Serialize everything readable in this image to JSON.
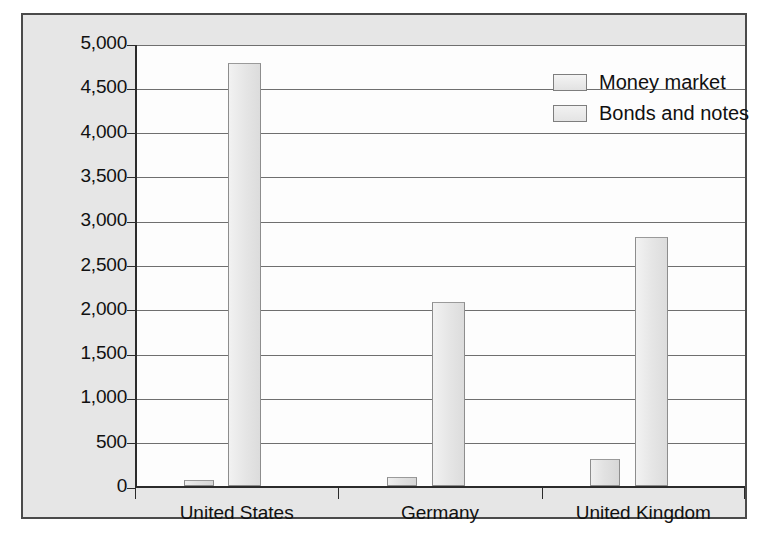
{
  "chart_data": {
    "type": "bar",
    "title": "",
    "xlabel": "",
    "ylabel": "",
    "categories": [
      "United States",
      "Germany",
      "United Kingdom"
    ],
    "series": [
      {
        "name": "Money market",
        "values": [
          70,
          100,
          300
        ]
      },
      {
        "name": "Bonds and notes",
        "values": [
          4780,
          2080,
          2810
        ]
      }
    ],
    "ylim": [
      0,
      5000
    ],
    "ytick_values": [
      0,
      500,
      1000,
      1500,
      2000,
      2500,
      3000,
      3500,
      4000,
      4500,
      5000
    ],
    "ytick_labels": [
      "0",
      "500",
      "1,000",
      "1,500",
      "2,000",
      "2,500",
      "3,000",
      "3,500",
      "4,000",
      "4,500",
      "5,000"
    ],
    "grid": true,
    "legend_position": "top-right",
    "colors": {
      "series_money_market": "#e2e2e2",
      "series_bonds_notes": "#e6e6e6",
      "grid": "#6f6f6f",
      "axis": "#2b2b2b",
      "frame": "#4a4a4a",
      "figure_background": "#e6e6e6",
      "plot_background": "#fdfdfd",
      "text": "#111111"
    }
  },
  "legend": {
    "items": [
      {
        "label": "Money market"
      },
      {
        "label": "Bonds and notes"
      }
    ]
  },
  "bleed_through": [
    {
      "text": "Calculating Returns on a Eurodollar Deposit",
      "x": 150,
      "y": 128,
      "size": 22,
      "weight": "bold"
    },
    {
      "text": "er gain the liquid-",
      "x": 420,
      "y": 55,
      "size": 19,
      "weight": "normal"
    },
    {
      "text": "the loan and there to invest in   More",
      "x": 95,
      "y": 55,
      "size": 19,
      "weight": "normal"
    },
    {
      "text": "ity that they may more effective.",
      "x": 235,
      "y": 88,
      "size": 19,
      "weight": "normal"
    },
    {
      "text": "Consider an MNC making a deposit of $5 million for one",
      "x": 110,
      "y": 175,
      "size": 21,
      "weight": "normal"
    },
    {
      "text": "percent. Using the convention that interest is calculated",
      "x": 118,
      "y": 205,
      "size": 21,
      "weight": "normal"
    },
    {
      "text": "the MNC will receive the following payment",
      "x": 135,
      "y": 238,
      "size": 21,
      "weight": "normal"
    },
    {
      "text": "P = $5,000,000 1 + 0.02 ×",
      "x": 200,
      "y": 305,
      "size": 22,
      "weight": "normal"
    },
    {
      "text": "90",
      "x": 345,
      "y": 330,
      "size": 14,
      "weight": "normal"
    },
    {
      "text": "36",
      "x": 342,
      "y": 282,
      "size": 14,
      "weight": "normal"
    },
    {
      "text": "The annual return on this Eurodollar deposit",
      "x": 130,
      "y": 388,
      "size": 21,
      "weight": "normal"
    },
    {
      "text": "The annual return =",
      "x": 200,
      "y": 437,
      "size": 21,
      "weight": "normal"
    },
    {
      "text": "$5,000",
      "x": 365,
      "y": 425,
      "size": 15,
      "weight": "normal"
    }
  ]
}
